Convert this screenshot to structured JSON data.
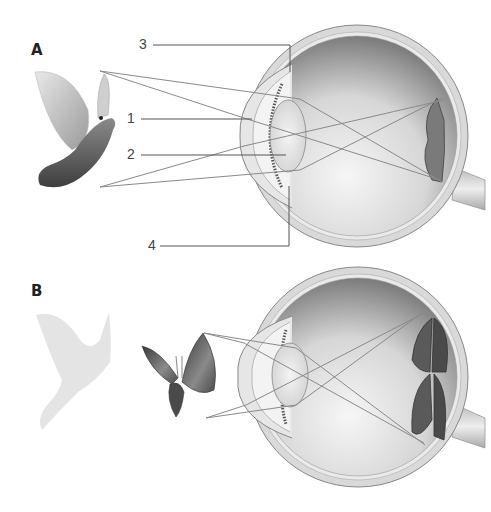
{
  "panels": {
    "a": {
      "label": "A",
      "object": "pigeon",
      "retina_image": "inverted pigeon"
    },
    "b": {
      "label": "B",
      "object": "butterfly",
      "faded_object": "pigeon silhouette",
      "retina_image": "inverted butterfly"
    }
  },
  "callouts": [
    {
      "number": "1"
    },
    {
      "number": "2"
    },
    {
      "number": "3"
    },
    {
      "number": "4"
    }
  ],
  "colors": {
    "line": "#555555",
    "ray": "#8a8a8a",
    "sclera": "#d8d8d8",
    "interior_dark": "#6e6e6e",
    "interior_light": "#f2f2f2"
  }
}
